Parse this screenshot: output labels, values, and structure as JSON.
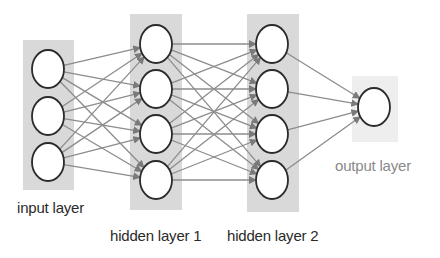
{
  "diagram": {
    "type": "feedforward-neural-network",
    "colors": {
      "background": "#ffffff",
      "layer_box": "#d9d9d9",
      "output_box": "#eeeeee",
      "node_fill": "#ffffff",
      "node_stroke": "#2b2b2b",
      "edge": "#8c8c8c",
      "arrowhead": "#7a7a7a",
      "label": "#2a2a2a",
      "label_light": "#8a8a8a"
    },
    "layers": [
      {
        "id": "input",
        "label": "input layer",
        "node_count": 3,
        "box": {
          "x": 23,
          "y": 40,
          "w": 51,
          "h": 150
        },
        "node_x": 48,
        "node_ys": [
          69,
          116,
          162
        ],
        "label_pos": {
          "x": 17,
          "y": 199
        }
      },
      {
        "id": "hidden1",
        "label": "hidden layer 1",
        "node_count": 4,
        "box": {
          "x": 130,
          "y": 14,
          "w": 52,
          "h": 196
        },
        "node_x": 156,
        "node_ys": [
          44,
          89,
          134,
          180
        ],
        "label_pos": {
          "x": 110,
          "y": 227
        }
      },
      {
        "id": "hidden2",
        "label": "hidden layer 2",
        "node_count": 4,
        "box": {
          "x": 247,
          "y": 14,
          "w": 52,
          "h": 198
        },
        "node_x": 272,
        "node_ys": [
          44,
          89,
          134,
          180
        ],
        "label_pos": {
          "x": 227,
          "y": 227
        }
      },
      {
        "id": "output",
        "label": "output layer",
        "node_count": 1,
        "box": {
          "x": 352,
          "y": 76,
          "w": 46,
          "h": 66
        },
        "node_x": 374,
        "node_ys": [
          107
        ],
        "label_pos": {
          "x": 335,
          "y": 157
        }
      }
    ],
    "node_rx": 16,
    "node_ry": 19,
    "connections": "fully-connected between consecutive layers, arrowheads at target nodes"
  }
}
